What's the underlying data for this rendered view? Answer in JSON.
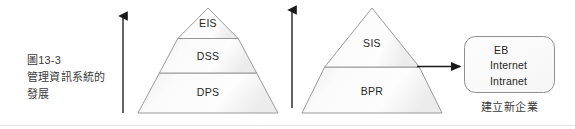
{
  "figure": {
    "caption": {
      "line1": "圖13-3",
      "line2": "管理資訊系統的",
      "line3": "發展"
    },
    "left_pyramid": {
      "tiers": [
        {
          "label": "EIS"
        },
        {
          "label": "DSS"
        },
        {
          "label": "DPS"
        }
      ]
    },
    "right_pyramid": {
      "tiers": [
        {
          "label": "SIS"
        },
        {
          "label": "BPR"
        }
      ]
    },
    "result_box": {
      "lines": [
        "EB",
        "Internet",
        "Intranet"
      ],
      "caption": "建立新企業"
    },
    "arrows": {
      "left": {
        "direction": "up"
      },
      "middle": {
        "direction": "down"
      },
      "right": {
        "direction": "right"
      }
    },
    "colors": {
      "outline": "#8c8c8c",
      "text": "#262626",
      "caption_text": "#3a3a3a",
      "arrow": "#1a1a1a",
      "fill_light": "#fdfdfd",
      "fill_shade": "#ebebeb",
      "baseline": "#e2e2e2"
    }
  }
}
